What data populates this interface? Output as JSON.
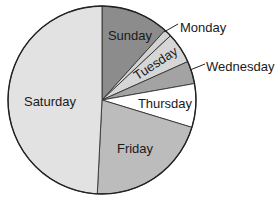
{
  "chart_data": {
    "type": "pie",
    "title": "",
    "start_angle_deg": 0,
    "direction": "clockwise",
    "categories": [
      "Sunday",
      "Monday",
      "Tuesday",
      "Wednesday",
      "Thursday",
      "Friday",
      "Saturday"
    ],
    "values": [
      11.7,
      1.3,
      5.3,
      3.9,
      7.5,
      21.1,
      49.2
    ],
    "unit": "percent (estimated from slice angles)",
    "colors": [
      "#8c8c8c",
      "#d2d2d2",
      "#d6d6d6",
      "#a3a3a3",
      "#ffffff",
      "#bcbcbc",
      "#e2e2e2"
    ],
    "legend": "none (direct labels)",
    "labels": [
      {
        "text": "Sunday",
        "x": 130,
        "y": 40,
        "rotate": 0,
        "anchor": "middle"
      },
      {
        "text": "Monday",
        "x": 180,
        "y": 32,
        "rotate": 0,
        "anchor": "start",
        "leader": [
          164,
          32,
          178,
          24
        ]
      },
      {
        "text": "Tuesday",
        "x": 158,
        "y": 67,
        "rotate": -33,
        "anchor": "middle"
      },
      {
        "text": "Wednesday",
        "x": 206,
        "y": 71,
        "rotate": 0,
        "anchor": "start",
        "leader": [
          190,
          70,
          205,
          64
        ]
      },
      {
        "text": "Thursday",
        "x": 165,
        "y": 108,
        "rotate": 0,
        "anchor": "middle"
      },
      {
        "text": "Friday",
        "x": 135,
        "y": 153,
        "rotate": 0,
        "anchor": "middle"
      },
      {
        "text": "Saturday",
        "x": 50,
        "y": 106,
        "rotate": 0,
        "anchor": "middle"
      }
    ],
    "geometry": {
      "cx": 102,
      "cy": 100,
      "r": 94
    }
  }
}
